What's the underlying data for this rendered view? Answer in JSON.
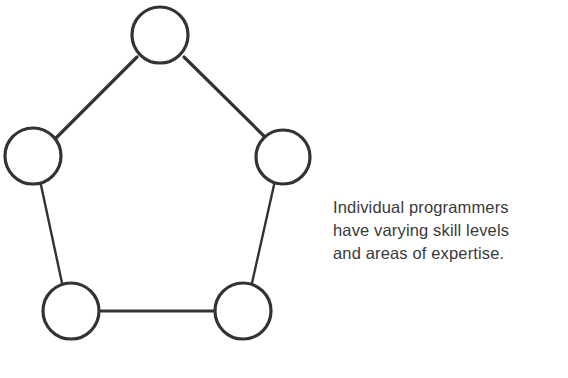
{
  "figure": {
    "background_color": "#ffffff",
    "stroke_color": "#333333",
    "text_color": "#3a3a3a",
    "caption": {
      "lines": [
        "Individual programmers",
        "have varying skill levels",
        "and areas of expertise."
      ],
      "full_text": "Individual programmers have varying skill levels and areas of expertise."
    },
    "diagram": {
      "type": "node-link-pentagon",
      "node_count": 5,
      "edge_count": 5,
      "node_label": "",
      "nodes": [
        {
          "id": "top",
          "cx": 160,
          "cy": 35,
          "r": 28,
          "stroke_width": 3.2
        },
        {
          "id": "upper-right",
          "cx": 283,
          "cy": 157,
          "r": 27,
          "stroke_width": 3.2
        },
        {
          "id": "lower-right",
          "cx": 243,
          "cy": 311,
          "r": 28,
          "stroke_width": 3.2
        },
        {
          "id": "lower-left",
          "cx": 71,
          "cy": 311,
          "r": 28,
          "stroke_width": 3.2
        },
        {
          "id": "upper-left",
          "cx": 33,
          "cy": 156,
          "r": 28,
          "stroke_width": 3.2
        }
      ],
      "edges": [
        {
          "from": "upper-left",
          "to": "top",
          "x1": 56,
          "y1": 138,
          "x2": 137,
          "y2": 57,
          "stroke_width": 3.2
        },
        {
          "from": "top",
          "to": "upper-right",
          "x1": 184,
          "y1": 57,
          "x2": 265,
          "y2": 137,
          "stroke_width": 3.2
        },
        {
          "from": "upper-right",
          "to": "lower-right",
          "x1": 274,
          "y1": 185,
          "x2": 252,
          "y2": 283,
          "stroke_width": 2.4
        },
        {
          "from": "lower-right",
          "to": "lower-left",
          "x1": 214,
          "y1": 311,
          "x2": 101,
          "y2": 311,
          "stroke_width": 2.8
        },
        {
          "from": "lower-left",
          "to": "upper-left",
          "x1": 62,
          "y1": 283,
          "x2": 41,
          "y2": 185,
          "stroke_width": 2.4
        }
      ]
    }
  }
}
